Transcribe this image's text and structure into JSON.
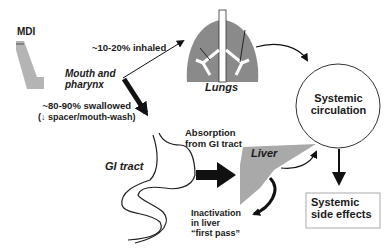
{
  "colors": {
    "organ_fill": "#8c8c8c",
    "liver_fill": "#a9a9a9",
    "mdi_fill": "#b4b4b4",
    "line": "#111111",
    "text": "#1a1a1a"
  },
  "nodes": {
    "mdi": "MDI",
    "mouth": "Mouth and pharynx",
    "mouth_line1": "Mouth and",
    "mouth_line2": "pharynx",
    "lungs": "Lungs",
    "gi_tract": "GI tract",
    "liver": "Liver",
    "circulation_line1": "Systemic",
    "circulation_line2": "circulation",
    "side_effects_line1": "Systemic",
    "side_effects_line2": "side effects"
  },
  "edges": {
    "inhaled": "~10-20% inhaled",
    "swallowed_line1": "~80-90% swallowed",
    "swallowed_line2": "(↓ spacer/mouth-wash)",
    "absorption_line1": "Absorption",
    "absorption_line2": "from GI tract",
    "inactivation_line1": "Inactivation",
    "inactivation_line2": "in liver",
    "inactivation_line3": "“first pass”"
  }
}
